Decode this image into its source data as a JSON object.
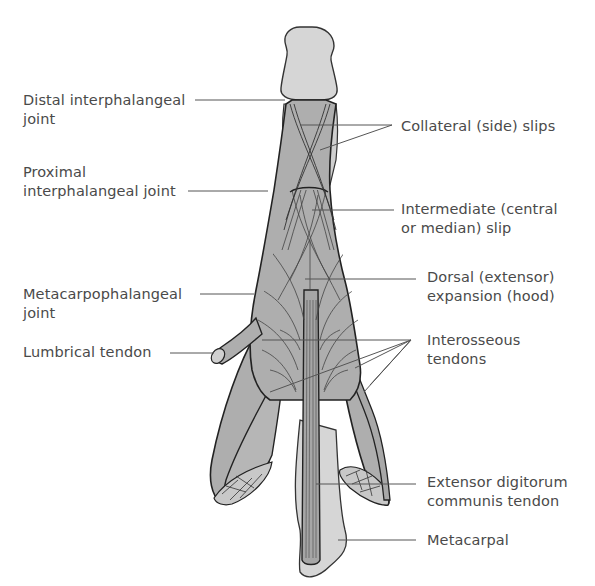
{
  "figure": {
    "colors": {
      "tissue_fill": "#aeaeae",
      "bone_fill": "#d6d6d6",
      "outline": "#333333",
      "leader_line": "#555555",
      "label_text": "#4a4a4a"
    }
  },
  "labels": {
    "left": [
      {
        "id": "distal-ip-joint",
        "lines": [
          "Distal interphalangeal",
          "joint"
        ]
      },
      {
        "id": "proximal-ip-joint",
        "lines": [
          "Proximal",
          "interphalangeal joint"
        ]
      },
      {
        "id": "mcp-joint",
        "lines": [
          "Metacarpophalangeal",
          "joint"
        ]
      },
      {
        "id": "lumbrical-tendon",
        "lines": [
          "Lumbrical tendon"
        ]
      }
    ],
    "right": [
      {
        "id": "collateral-slips",
        "lines": [
          "Collateral (side) slips"
        ]
      },
      {
        "id": "intermediate-slip",
        "lines": [
          "Intermediate (central",
          "or median) slip"
        ]
      },
      {
        "id": "dorsal-expansion",
        "lines": [
          "Dorsal (extensor)",
          "expansion (hood)"
        ]
      },
      {
        "id": "interosseous-tendons",
        "lines": [
          "Interosseous",
          "tendons"
        ]
      },
      {
        "id": "edc-tendon",
        "lines": [
          "Extensor digitorum",
          "communis tendon"
        ]
      },
      {
        "id": "metacarpal",
        "lines": [
          "Metacarpal"
        ]
      }
    ]
  }
}
